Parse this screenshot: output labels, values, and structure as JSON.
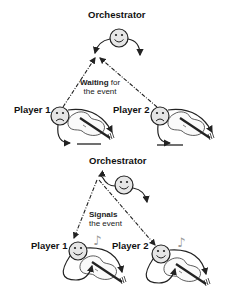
{
  "panels": [
    {
      "state": "waiting",
      "orchestrator_label": "Orchestrator",
      "player1_label": "Player 1",
      "player2_label": "Player 2",
      "caption_bold": "Waiting",
      "caption_rest": " for",
      "caption_line2": "the event",
      "orchestrator_face": "smile",
      "player_face": "frown"
    },
    {
      "state": "signaled",
      "orchestrator_label": "Orchestrator",
      "player1_label": "Player 1",
      "player2_label": "Player 2",
      "caption_bold": "Signals",
      "caption_rest": "",
      "caption_line2": "the event",
      "orchestrator_face": "smile",
      "player_face": "smile"
    }
  ],
  "colors": {
    "face_fill": "#e6e6e6",
    "stroke": "#222222",
    "note": "#999999"
  }
}
